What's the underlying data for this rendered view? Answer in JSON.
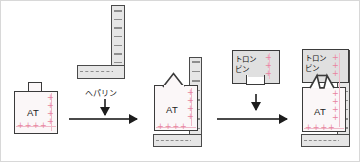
{
  "figure": {
    "background_color": "#ffffff"
  },
  "colors": {
    "protein_fill": "#fbf7f8",
    "protein_stroke": "#3b3b3b",
    "heparin_fill": "#e6e6e6",
    "heparin_stroke": "#4a4a4a",
    "heparin_dash": "#8d8d8d",
    "thrombin_fill": "#e0e0e0",
    "positive_charge": "#e8849f",
    "arrow": "#1d1d1d"
  },
  "steps": [
    {
      "id": "step-1",
      "name": "inactive-antithrombin",
      "label": "AT",
      "charge_symbols": "++++",
      "description": "Inactive antithrombin with closed reactive loop"
    },
    {
      "id": "step-2",
      "name": "heparin-bound-antithrombin",
      "label": "AT",
      "charge_symbols": "++++",
      "description": "Antithrombin activated by heparin binding"
    },
    {
      "id": "step-3",
      "name": "thrombin-antithrombin-complex",
      "label": "AT",
      "charge_symbols": "++++",
      "description": "Thrombin captured by activated antithrombin"
    }
  ],
  "reagents": {
    "heparin": {
      "name": "heparin-molecule",
      "label": "ヘパリン",
      "charge_symbols": "- - - -"
    },
    "thrombin": {
      "name": "thrombin-molecule",
      "label_line1": "トロン",
      "label_line2": "ビン",
      "charge_symbols": "+++"
    }
  },
  "arrows": {
    "reaction_1": {
      "name": "reaction-arrow-1",
      "direction": "right"
    },
    "reaction_2": {
      "name": "reaction-arrow-2",
      "direction": "right"
    },
    "addition_1": {
      "name": "heparin-addition-arrow",
      "direction": "down"
    },
    "addition_2": {
      "name": "thrombin-addition-arrow",
      "direction": "down"
    }
  }
}
